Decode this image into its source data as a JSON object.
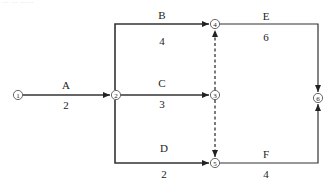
{
  "diagram": {
    "type": "activity-on-arrow network diagram",
    "faint_header_text": "... ... ......",
    "colors": {
      "line": "#333333",
      "node_stroke": "#444444",
      "text": "#222222",
      "background": "#ffffff"
    },
    "nodes": [
      {
        "id": "1",
        "label": "①",
        "x": 18,
        "y": 95
      },
      {
        "id": "2",
        "label": "②",
        "x": 116,
        "y": 95
      },
      {
        "id": "3",
        "label": "③",
        "x": 215,
        "y": 95
      },
      {
        "id": "4",
        "label": "④",
        "x": 215,
        "y": 24
      },
      {
        "id": "5",
        "label": "⑤",
        "x": 215,
        "y": 163
      },
      {
        "id": "6",
        "label": "⑥",
        "x": 318,
        "y": 98
      }
    ],
    "activities": [
      {
        "name": "A",
        "duration": "2",
        "from": "1",
        "to": "2",
        "style": "solid"
      },
      {
        "name": "B",
        "duration": "4",
        "from": "2",
        "to": "4",
        "style": "solid"
      },
      {
        "name": "C",
        "duration": "3",
        "from": "2",
        "to": "3",
        "style": "solid"
      },
      {
        "name": "D",
        "duration": "2",
        "from": "2",
        "to": "5",
        "style": "solid"
      },
      {
        "name": "E",
        "duration": "6",
        "from": "4",
        "to": "6",
        "style": "solid"
      },
      {
        "name": "F",
        "duration": "4",
        "from": "5",
        "to": "6",
        "style": "solid"
      },
      {
        "name": "dummy-3-4",
        "duration": "",
        "from": "3",
        "to": "4",
        "style": "dashed"
      },
      {
        "name": "dummy-3-5",
        "duration": "",
        "from": "3",
        "to": "5",
        "style": "dashed"
      }
    ]
  }
}
